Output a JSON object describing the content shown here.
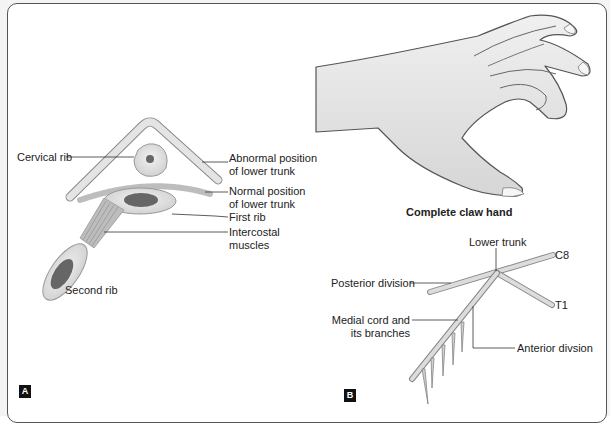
{
  "figure": {
    "panel_a": {
      "tag": "A",
      "labels": {
        "cervical_rib": "Cervical rib",
        "abnormal_position_line1": "Abnormal position",
        "abnormal_position_line2": "of lower trunk",
        "normal_position_line1": "Normal position",
        "normal_position_line2": "of lower trunk",
        "first_rib": "First rib",
        "intercostal_line1": "Intercostal",
        "intercostal_line2": "muscles",
        "second_rib": "Second rib"
      }
    },
    "panel_b": {
      "tag": "B",
      "caption": "Complete claw hand",
      "labels": {
        "lower_trunk": "Lower trunk",
        "c8": "C8",
        "t1": "T1",
        "posterior_division": "Posterior division",
        "medial_cord_line1": "Medial cord and",
        "medial_cord_line2": "its branches",
        "anterior_division": "Anterior divsion"
      }
    },
    "colors": {
      "frame_border": "#555555",
      "bone_fill": "#e2e2e2",
      "marrow_fill": "#6a6a6a",
      "nerve_fill": "#d8d8d8",
      "skin_fill": "#e6e6e6",
      "tag_bg": "#111111"
    }
  }
}
